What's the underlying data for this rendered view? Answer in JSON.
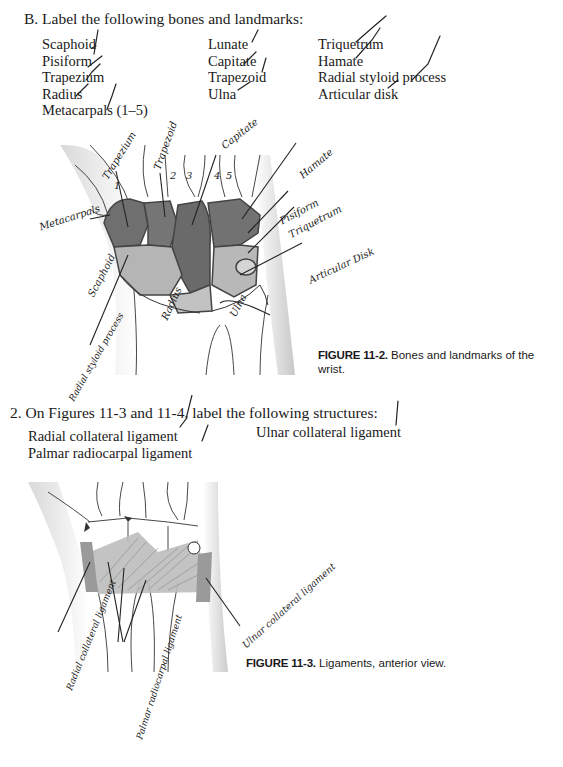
{
  "section_b": {
    "heading": "B.  Label the following bones and landmarks:",
    "columns": [
      [
        "Scaphoid",
        "Pisiform",
        "Trapezium",
        "Radius",
        "Metacarpals (1–5)"
      ],
      [
        "Lunate",
        "Capitate",
        "Trapezoid",
        "Ulna"
      ],
      [
        "Triquetrum",
        "Hamate",
        "Radial styloid process",
        "Articular disk"
      ]
    ]
  },
  "figure_11_2": {
    "label": "FIGURE 11-2.",
    "caption_line1": "Bones and landmarks of the",
    "caption_line2": "wrist.",
    "handwritten_labels": {
      "trapezium": "Trapezium",
      "trapezoid": "Trapezoid",
      "capitate": "Capitate",
      "hamate": "Hamate",
      "pisiform": "Pisiform",
      "triquetrum": "Triquetrum",
      "articular_disk": "Articular Disk",
      "metacarpals": "Metacarpals",
      "scaphoid": "Scaphoid",
      "radius": "Radius",
      "ulna": "Ulna",
      "radial_styloid": "Radial styloid process",
      "mc_numbers": [
        "1",
        "2",
        "3",
        "4",
        "5"
      ]
    }
  },
  "section_2": {
    "heading": "2.  On Figures 11-3 and 11-4, label the following structures:",
    "items_left": [
      "Radial collateral ligament",
      "Palmar radiocarpal ligament"
    ],
    "items_right": [
      "Ulnar collateral ligament"
    ]
  },
  "figure_11_3": {
    "label": "FIGURE 11-3.",
    "caption": "Ligaments, anterior view.",
    "handwritten_labels": {
      "radial_collateral": "Radial collateral ligament",
      "palmar_radiocarpal": "Palmar radiocarpal ligament",
      "ulnar_collateral": "Ulnar collateral ligament"
    }
  }
}
